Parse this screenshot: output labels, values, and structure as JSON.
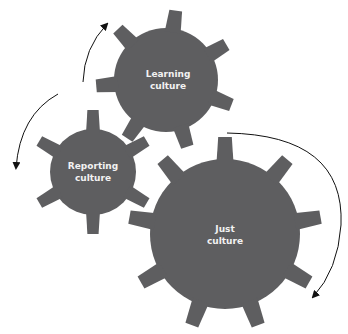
{
  "diagram": {
    "gear_color": "#5e5e60",
    "text_color": "#f2f2f2",
    "arrow_color": "#111111",
    "gears": [
      {
        "id": "learning",
        "line1": "Learning",
        "line2": "culture"
      },
      {
        "id": "reporting",
        "line1": "Reporting",
        "line2": "culture"
      },
      {
        "id": "just",
        "line1": "Just",
        "line2": "culture"
      }
    ]
  }
}
